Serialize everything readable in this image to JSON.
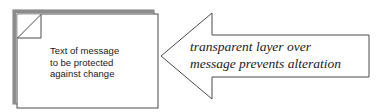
{
  "document": {
    "lines": [
      "Text of message",
      "to be protected",
      "against change"
    ]
  },
  "annotation": {
    "lines": [
      "transparent layer over",
      "message prevents alteration"
    ],
    "shape": "left-pointing-arrow"
  },
  "colors": {
    "stroke": "#4a4a4a",
    "shadow": "#8c8c8c",
    "fill": "#ffffff",
    "text": "#1a1a1a"
  }
}
